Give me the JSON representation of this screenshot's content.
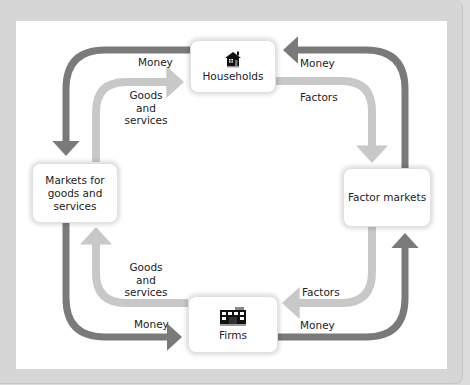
{
  "diagram": {
    "type": "circular-flow",
    "nodes": {
      "households": {
        "label": "Households",
        "icon": "house-icon"
      },
      "firms": {
        "label": "Firms",
        "icon": "building-icon"
      },
      "goods_markets": {
        "label": "Markets for goods and services",
        "lines": [
          "Markets for",
          "goods and",
          "services"
        ]
      },
      "factor_markets": {
        "label": "Factor markets"
      }
    },
    "flows": {
      "top_left_money": "Money",
      "top_left_goods": [
        "Goods",
        "and",
        "services"
      ],
      "top_right_money": "Money",
      "top_right_factors": "Factors",
      "bottom_left_goods": [
        "Goods",
        "and",
        "services"
      ],
      "bottom_left_money": "Money",
      "bottom_right_factors": "Factors",
      "bottom_right_money": "Money"
    },
    "colors": {
      "money_flow": "#7a7a7a",
      "real_flow": "#c8c8c8",
      "frame": "#d6d6d6",
      "panel": "#ffffff"
    }
  }
}
